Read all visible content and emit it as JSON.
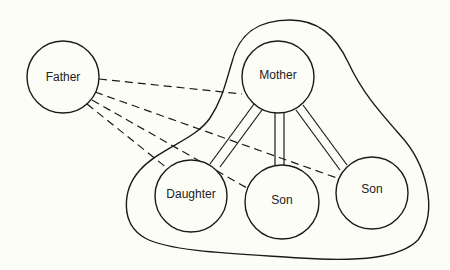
{
  "diagram": {
    "type": "family-relationship-diagram",
    "nodes": [
      {
        "id": "father",
        "label": "Father",
        "cx": 63,
        "cy": 77,
        "r": 36
      },
      {
        "id": "mother",
        "label": "Mother",
        "cx": 278,
        "cy": 77,
        "r": 36
      },
      {
        "id": "daughter",
        "label": "Daughter",
        "cx": 191,
        "cy": 196,
        "r": 36
      },
      {
        "id": "son1",
        "label": "Son",
        "cx": 282,
        "cy": 202,
        "r": 37
      },
      {
        "id": "son2",
        "label": "Son",
        "cx": 372,
        "cy": 193,
        "r": 36
      }
    ],
    "group": {
      "label": "",
      "members": [
        "mother",
        "daughter",
        "son1",
        "son2"
      ]
    },
    "edges": [
      {
        "from": "father",
        "to": "mother",
        "style": "dashed"
      },
      {
        "from": "father",
        "to": "son2",
        "style": "dashed"
      },
      {
        "from": "father",
        "to": "son1",
        "style": "dashed"
      },
      {
        "from": "father",
        "to": "daughter",
        "style": "dashed"
      },
      {
        "from": "mother",
        "to": "daughter",
        "style": "double"
      },
      {
        "from": "mother",
        "to": "son1",
        "style": "double"
      },
      {
        "from": "mother",
        "to": "son2",
        "style": "double"
      }
    ]
  }
}
